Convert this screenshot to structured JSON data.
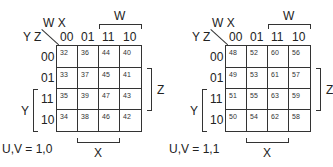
{
  "maps": [
    {
      "corner_top": "W X",
      "corner_left": "Y Z",
      "col_headers": [
        "00",
        "01",
        "11",
        "10"
      ],
      "row_headers": [
        "00",
        "01",
        "11",
        "10"
      ],
      "cells": [
        [
          "32",
          "36",
          "44",
          "40"
        ],
        [
          "33",
          "37",
          "45",
          "41"
        ],
        [
          "35",
          "39",
          "47",
          "43"
        ],
        [
          "34",
          "38",
          "46",
          "42"
        ]
      ],
      "bracket_w": "W",
      "bracket_z": "Z",
      "bracket_y": "Y",
      "bracket_x": "X",
      "caption": "U,V = 1,0"
    },
    {
      "corner_top": "W X",
      "corner_left": "Y Z",
      "col_headers": [
        "00",
        "01",
        "11",
        "10"
      ],
      "row_headers": [
        "00",
        "01",
        "11",
        "10"
      ],
      "cells": [
        [
          "48",
          "52",
          "60",
          "56"
        ],
        [
          "49",
          "53",
          "61",
          "57"
        ],
        [
          "51",
          "55",
          "63",
          "59"
        ],
        [
          "50",
          "54",
          "62",
          "58"
        ]
      ],
      "bracket_w": "W",
      "bracket_z": "Z",
      "bracket_y": "Y",
      "bracket_x": "X",
      "caption": "U,V = 1,1"
    }
  ]
}
